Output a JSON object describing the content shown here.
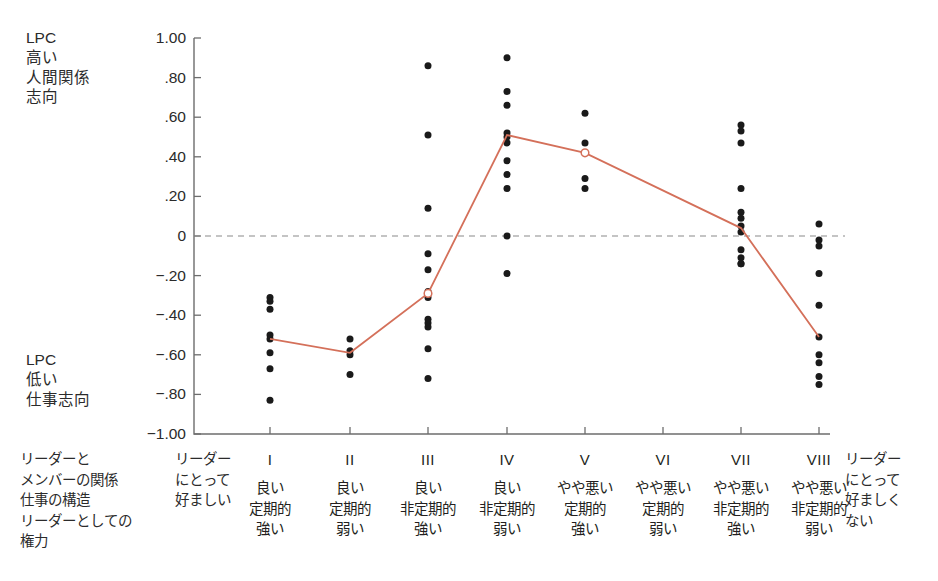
{
  "axis_labels": {
    "high": "LPC\n高い\n人間関係\n志向",
    "low": "LPC\n低い\n仕事志向"
  },
  "row_labels": "リーダーと\nメンバーの関係\n仕事の構造\nリーダーとしての\n権力",
  "favourable_label": "リーダー\nにとって\n好ましい",
  "unfavourable_label": "リーダー\nにとって\n好ましく\nない",
  "y_ticks": [
    "1.00",
    ".80",
    ".60",
    ".40",
    ".20",
    "0",
    "−.20",
    "−.40",
    "−.60",
    "−.80",
    "−1.00"
  ],
  "y_tick_values": [
    1.0,
    0.8,
    0.6,
    0.4,
    0.2,
    0,
    -0.2,
    -0.4,
    -0.6,
    -0.8,
    -1.0
  ],
  "columns": [
    {
      "roman": "I",
      "relation": "良い",
      "structure": "定期的",
      "power": "強い"
    },
    {
      "roman": "II",
      "relation": "良い",
      "structure": "定期的",
      "power": "弱い"
    },
    {
      "roman": "III",
      "relation": "良い",
      "structure": "非定期的",
      "power": "強い"
    },
    {
      "roman": "IV",
      "relation": "良い",
      "structure": "非定期的",
      "power": "弱い"
    },
    {
      "roman": "V",
      "relation": "やや悪い",
      "structure": "定期的",
      "power": "強い"
    },
    {
      "roman": "VI",
      "relation": "やや悪い",
      "structure": "定期的",
      "power": "弱い"
    },
    {
      "roman": "VII",
      "relation": "やや悪い",
      "structure": "非定期的",
      "power": "強い"
    },
    {
      "roman": "VIII",
      "relation": "やや悪い",
      "structure": "非定期的",
      "power": "弱い"
    }
  ],
  "colors": {
    "line": "#d4705a",
    "point": "#1a1a1a",
    "axis": "#6d6d6d",
    "zero_line": "#8a8a8a",
    "text": "#2b2b2b"
  },
  "chart_data": {
    "type": "scatter",
    "title": "",
    "xlabel": "",
    "ylabel": "LPC",
    "ylim": [
      -1.0,
      1.0
    ],
    "grid": false,
    "legend": "none",
    "zero_reference_line": 0,
    "categories": [
      "I",
      "II",
      "III",
      "IV",
      "V",
      "VI",
      "VII",
      "VIII"
    ],
    "scatter_points": [
      {
        "category": "I",
        "values": [
          -0.31,
          -0.33,
          -0.37,
          -0.5,
          -0.52,
          -0.59,
          -0.67,
          -0.83
        ]
      },
      {
        "category": "II",
        "values": [
          -0.52,
          -0.58,
          -0.6,
          -0.7
        ]
      },
      {
        "category": "III",
        "values": [
          0.86,
          0.51,
          0.14,
          -0.09,
          -0.17,
          -0.28,
          -0.31,
          -0.42,
          -0.44,
          -0.46,
          -0.57,
          -0.72
        ]
      },
      {
        "category": "IV",
        "values": [
          0.9,
          0.73,
          0.66,
          0.52,
          0.5,
          0.47,
          0.38,
          0.31,
          0.24,
          0.0,
          -0.19
        ]
      },
      {
        "category": "V",
        "values": [
          0.62,
          0.47,
          0.42,
          0.29,
          0.24
        ]
      },
      {
        "category": "VI",
        "values": []
      },
      {
        "category": "VII",
        "values": [
          0.56,
          0.53,
          0.47,
          0.24,
          0.12,
          0.09,
          0.05,
          0.02,
          -0.07,
          -0.11,
          -0.14,
          -0.14
        ]
      },
      {
        "category": "VIII",
        "values": [
          0.06,
          -0.02,
          -0.05,
          -0.19,
          -0.35,
          -0.51,
          -0.6,
          -0.64,
          -0.71,
          -0.75
        ]
      }
    ],
    "line_series": {
      "name": "median correlation",
      "marker": "open-circle at III and V",
      "x": [
        "I",
        "II",
        "III",
        "IV",
        "V",
        "VI",
        "VII",
        "VIII"
      ],
      "values": [
        -0.52,
        -0.59,
        -0.29,
        0.51,
        0.42,
        null,
        0.04,
        -0.51
      ]
    }
  }
}
